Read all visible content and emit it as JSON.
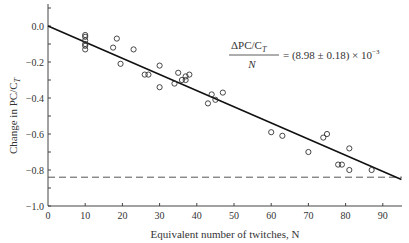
{
  "chart_data": {
    "type": "scatter",
    "title": "",
    "xlabel": "Equivalent number of twitches, N",
    "ylabel": "Change in PC/C_T",
    "xlim": [
      0,
      95
    ],
    "ylim": [
      -1.0,
      0.1
    ],
    "x_ticks": [
      0,
      10,
      20,
      30,
      40,
      50,
      60,
      70,
      80,
      90
    ],
    "y_ticks": [
      0.0,
      -0.2,
      -0.4,
      -0.6,
      -0.8,
      -1.0
    ],
    "x_tick_labels": [
      "0",
      "10",
      "20",
      "30",
      "40",
      "50",
      "60",
      "70",
      "80",
      "90"
    ],
    "y_tick_labels": [
      "0.0",
      "−0.2",
      "−0.4",
      "−0.6",
      "−0.8",
      "−1.0"
    ],
    "grid": false,
    "points": [
      [
        10,
        -0.05
      ],
      [
        10,
        -0.06
      ],
      [
        10,
        -0.08
      ],
      [
        10,
        -0.1
      ],
      [
        10,
        -0.11
      ],
      [
        10,
        -0.13
      ],
      [
        17.5,
        -0.12
      ],
      [
        18.5,
        -0.07
      ],
      [
        19.5,
        -0.21
      ],
      [
        23,
        -0.13
      ],
      [
        26,
        -0.27
      ],
      [
        27,
        -0.27
      ],
      [
        30,
        -0.34
      ],
      [
        30,
        -0.22
      ],
      [
        34,
        -0.32
      ],
      [
        35,
        -0.26
      ],
      [
        36,
        -0.3
      ],
      [
        37,
        -0.28
      ],
      [
        37,
        -0.3
      ],
      [
        38,
        -0.27
      ],
      [
        43,
        -0.43
      ],
      [
        44,
        -0.38
      ],
      [
        45,
        -0.41
      ],
      [
        47,
        -0.37
      ],
      [
        60,
        -0.59
      ],
      [
        63,
        -0.61
      ],
      [
        70,
        -0.7
      ],
      [
        74,
        -0.62
      ],
      [
        75,
        -0.6
      ],
      [
        78,
        -0.77
      ],
      [
        79,
        -0.77
      ],
      [
        81,
        -0.68
      ],
      [
        81,
        -0.8
      ],
      [
        87,
        -0.8
      ]
    ],
    "fit_line": {
      "x": [
        0,
        95
      ],
      "y": [
        0.0,
        -0.853
      ],
      "slope_per_twitch": -0.00898
    },
    "reference_line": {
      "y": -0.84,
      "style": "dashed"
    },
    "annotation": {
      "numerator": "ΔPC/C",
      "numerator_sub": "T",
      "denominator": "N",
      "value": "= (8.98 ± 0.18) × 10",
      "exponent": "−3"
    }
  }
}
